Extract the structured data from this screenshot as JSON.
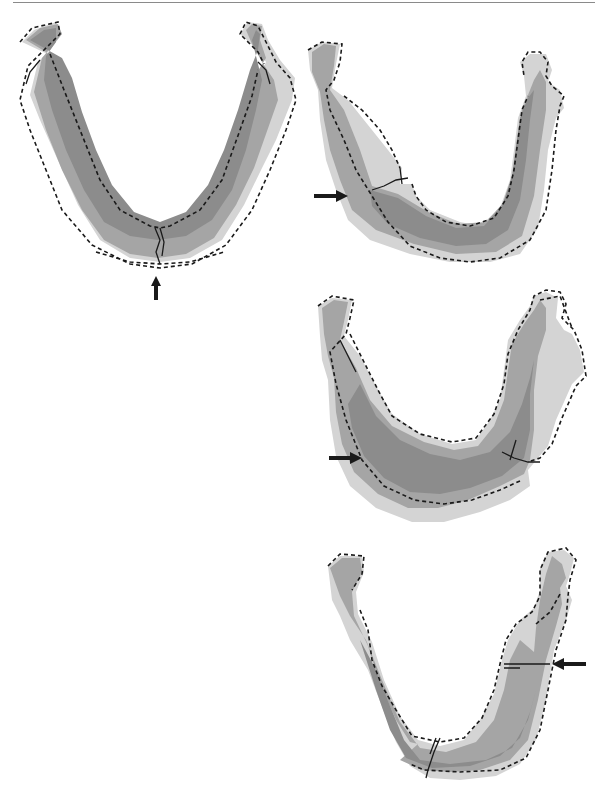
{
  "figure": {
    "panels": [
      {
        "id": "panel-1",
        "position": "top-left",
        "fracture_site": "midline symphysis",
        "arrow_direction": "up"
      },
      {
        "id": "panel-2",
        "position": "top-right",
        "fracture_site": "left body",
        "arrow_direction": "right"
      },
      {
        "id": "panel-3",
        "position": "middle-right",
        "fracture_site": "left body",
        "arrow_direction": "right"
      },
      {
        "id": "panel-4",
        "position": "bottom-right",
        "fracture_site": "right body",
        "arrow_direction": "left"
      }
    ],
    "colors": {
      "bone_dark": "#8c8c8c",
      "bone_mid": "#a5a5a5",
      "bone_light": "#d4d4d4",
      "outline": "#1a1a1a",
      "rule": "#8a8a8a"
    }
  }
}
